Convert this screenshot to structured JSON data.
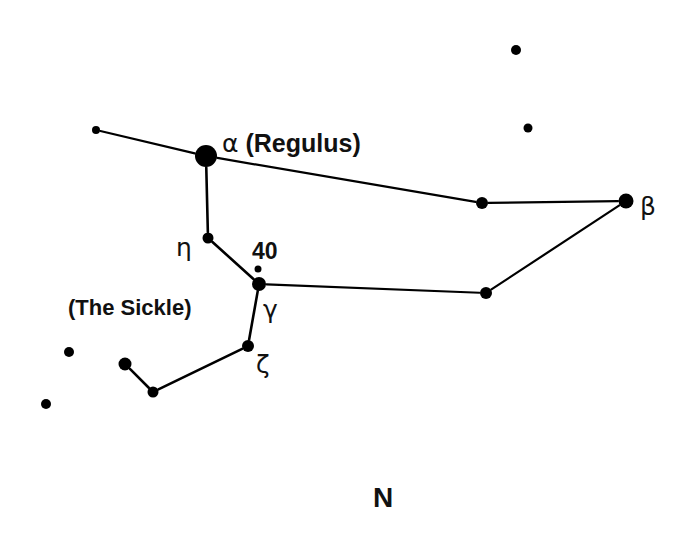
{
  "figure": {
    "background_color": "#ffffff",
    "ink_color": "#000000",
    "width": 691,
    "height": 535
  },
  "labels": {
    "alpha_regulus": "α (Regulus)",
    "alpha_symbol": "α",
    "alpha_name": "(Regulus)",
    "beta": "β",
    "gamma": "γ",
    "eta": "η",
    "zeta": "ζ",
    "star_40": "40",
    "the_sickle": "(The Sickle)",
    "north": "N"
  },
  "chart_data": {
    "type": "scatter",
    "xlabel": "",
    "ylabel": "",
    "grid": false,
    "legend": null,
    "xlim": [
      0,
      691
    ],
    "ylim": [
      0,
      535
    ],
    "axis_orientation": "screen pixels, y down",
    "stars": [
      {
        "id": "s1",
        "label": "",
        "x": 96,
        "y": 130,
        "r": 4.0,
        "magnitude_rank": 6
      },
      {
        "id": "s2",
        "label": "α (Regulus)",
        "x": 206,
        "y": 156,
        "r": 11.0,
        "magnitude_rank": 1
      },
      {
        "id": "s3",
        "label": "η",
        "x": 208,
        "y": 238,
        "r": 5.5,
        "magnitude_rank": 5
      },
      {
        "id": "s4",
        "label": "40",
        "x": 258,
        "y": 269,
        "r": 3.5,
        "magnitude_rank": 7
      },
      {
        "id": "s5",
        "label": "γ",
        "x": 259,
        "y": 284,
        "r": 7.0,
        "magnitude_rank": 3
      },
      {
        "id": "s6",
        "label": "ζ",
        "x": 248,
        "y": 346,
        "r": 6.0,
        "magnitude_rank": 4
      },
      {
        "id": "s7",
        "label": "",
        "x": 125,
        "y": 364,
        "r": 6.5,
        "magnitude_rank": 4
      },
      {
        "id": "s8",
        "label": "",
        "x": 153,
        "y": 392,
        "r": 5.5,
        "magnitude_rank": 5
      },
      {
        "id": "s9",
        "label": "",
        "x": 69,
        "y": 352,
        "r": 5.0,
        "magnitude_rank": 5
      },
      {
        "id": "s10",
        "label": "",
        "x": 46,
        "y": 404,
        "r": 5.0,
        "magnitude_rank": 5
      },
      {
        "id": "s11",
        "label": "",
        "x": 482,
        "y": 203,
        "r": 6.0,
        "magnitude_rank": 4
      },
      {
        "id": "s12",
        "label": "β",
        "x": 626,
        "y": 201,
        "r": 7.5,
        "magnitude_rank": 2
      },
      {
        "id": "s13",
        "label": "",
        "x": 486,
        "y": 293,
        "r": 6.0,
        "magnitude_rank": 4
      },
      {
        "id": "s14",
        "label": "",
        "x": 516,
        "y": 50,
        "r": 5.0,
        "magnitude_rank": 5
      },
      {
        "id": "s15",
        "label": "",
        "x": 528,
        "y": 128,
        "r": 4.5,
        "magnitude_rank": 6
      }
    ],
    "lines": [
      {
        "from": "s1",
        "to": "s2",
        "width": 2.2
      },
      {
        "from": "s2",
        "to": "s3",
        "width": 2.6
      },
      {
        "from": "s3",
        "to": "s5",
        "width": 2.6
      },
      {
        "from": "s5",
        "to": "s6",
        "width": 2.6
      },
      {
        "from": "s6",
        "to": "s8",
        "width": 2.6
      },
      {
        "from": "s8",
        "to": "s7",
        "width": 2.6
      },
      {
        "from": "s2",
        "to": "s11",
        "width": 2.2
      },
      {
        "from": "s11",
        "to": "s12",
        "width": 2.2
      },
      {
        "from": "s12",
        "to": "s13",
        "width": 2.2
      },
      {
        "from": "s13",
        "to": "s5",
        "width": 2.2
      }
    ],
    "text_annotations": [
      {
        "text": "α (Regulus)",
        "x": 222,
        "y": 152,
        "font_size": 25,
        "bold": true,
        "anchor": "start"
      },
      {
        "text": "β",
        "x": 640,
        "y": 215,
        "font_size": 25,
        "bold": false,
        "anchor": "start"
      },
      {
        "text": "η",
        "x": 176,
        "y": 256,
        "font_size": 25,
        "bold": false,
        "anchor": "start"
      },
      {
        "text": "40",
        "x": 252,
        "y": 259,
        "font_size": 23,
        "bold": true,
        "anchor": "start"
      },
      {
        "text": "γ",
        "x": 263,
        "y": 318,
        "font_size": 25,
        "bold": false,
        "anchor": "start"
      },
      {
        "text": "ζ",
        "x": 256,
        "y": 373,
        "font_size": 25,
        "bold": false,
        "anchor": "start"
      },
      {
        "text": "(The Sickle)",
        "x": 68,
        "y": 315,
        "font_size": 22,
        "bold": true,
        "anchor": "start"
      },
      {
        "text": "N",
        "x": 383,
        "y": 507,
        "font_size": 28,
        "bold": true,
        "anchor": "middle"
      }
    ]
  }
}
